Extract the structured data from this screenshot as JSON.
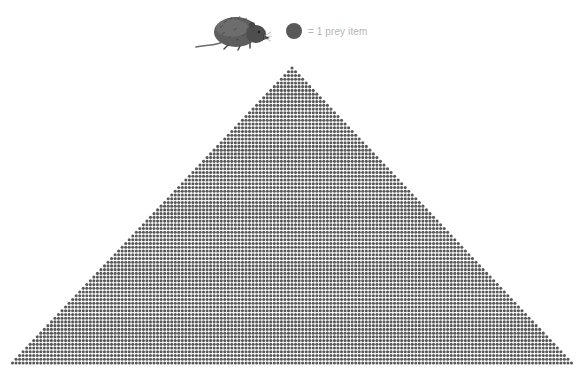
{
  "legend": {
    "symbol": "dark-grey-circle",
    "label": "= 1 prey item",
    "icon": "shrew-illustration",
    "dot_color": "#595959",
    "text_color": "#b5b5b5"
  },
  "chart_data": {
    "type": "pictograph-pyramid",
    "title": "",
    "unit_label": "= 1 prey item",
    "unit_value": 1,
    "rows_estimated": 80,
    "dots_per_row_rule": "row n (from top, 1-indexed) contains 2n-1 dots",
    "top_row_dots": 1,
    "bottom_row_dots_estimated": 159,
    "total_items_estimated": 6400,
    "apex": {
      "x": 292,
      "y": 68
    },
    "base": {
      "y": 363,
      "x_left": 12,
      "x_right": 571
    },
    "dot_pitch_px": 3.7,
    "dot_radius_px": 1.55,
    "dot_color": "#595959",
    "legend_position": "top-center",
    "grid": false,
    "axes": false
  }
}
